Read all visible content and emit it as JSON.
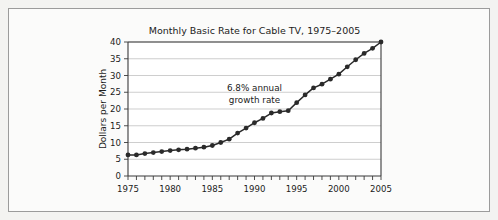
{
  "figure": {
    "background_color": "#f3f3f1",
    "panel_color": "#fbfbfa",
    "frame_color": "#9b9b9b"
  },
  "chart_data": {
    "type": "line",
    "title": "Monthly Basic Rate for Cable TV, 1975–2005",
    "xlabel": "",
    "ylabel": "Dollars per Month",
    "xlim": [
      1975,
      2005
    ],
    "ylim": [
      0,
      40
    ],
    "grid": true,
    "legend": null,
    "marker": "filled-circle",
    "line_color": "#2a2a2a",
    "ytick_labels": [
      "0",
      "5",
      "10",
      "15",
      "20",
      "25",
      "30",
      "35",
      "40"
    ],
    "yticks": [
      0,
      5,
      10,
      15,
      20,
      25,
      30,
      35,
      40
    ],
    "xtick_labels": [
      "1975",
      "1980",
      "1985",
      "1990",
      "1995",
      "2000",
      "2005"
    ],
    "xticks": [
      1975,
      1980,
      1985,
      1990,
      1995,
      2000,
      2005
    ],
    "xtick_minor_step": 1,
    "annotations": [
      {
        "text_line1": "6.8% annual",
        "text_line2": "growth rate",
        "x": 1990.0,
        "y": 25.5
      }
    ],
    "x": [
      1975,
      1976,
      1977,
      1978,
      1979,
      1980,
      1981,
      1982,
      1983,
      1984,
      1985,
      1986,
      1987,
      1988,
      1989,
      1990,
      1991,
      1992,
      1993,
      1994,
      1995,
      1996,
      1997,
      1998,
      1999,
      2000,
      2001,
      2002,
      2003,
      2004,
      2005
    ],
    "values": [
      6.3,
      6.3,
      6.7,
      7.0,
      7.3,
      7.6,
      7.8,
      8.0,
      8.3,
      8.6,
      9.1,
      10.0,
      11.0,
      12.8,
      14.3,
      15.9,
      17.2,
      18.8,
      19.2,
      19.5,
      21.9,
      24.2,
      26.3,
      27.4,
      28.9,
      30.4,
      32.6,
      34.7,
      36.6,
      38.1,
      40.0
    ],
    "series_name": "Monthly basic rate"
  }
}
